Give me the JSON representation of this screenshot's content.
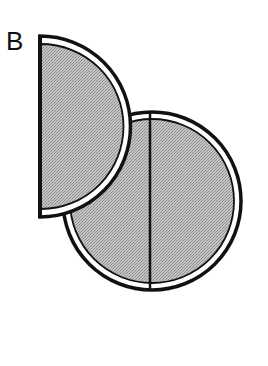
{
  "panel": {
    "label": "B"
  },
  "colors": {
    "fill": "#b4b4b4",
    "stroke": "#111111",
    "ring": "#ffffff",
    "background": "#ffffff"
  },
  "shapes": {
    "half_disc": {
      "description": "semicircle, flat edge on left",
      "flat_edge_x": 40,
      "top_y": 36,
      "bottom_y": 217,
      "radius": 90
    },
    "full_disc": {
      "description": "circle divided by vertical line",
      "center_x": 152,
      "center_y": 201,
      "radius": 90,
      "divider_x": 150
    }
  }
}
